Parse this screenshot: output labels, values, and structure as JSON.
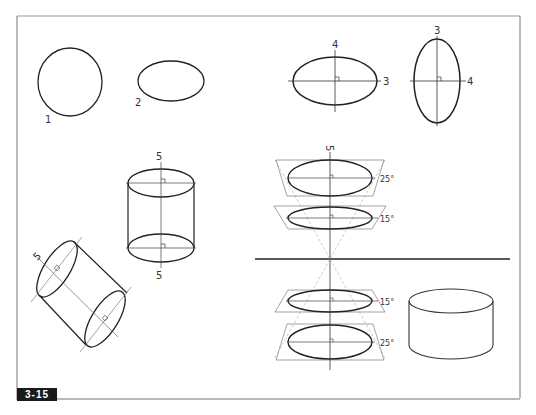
{
  "figure": {
    "label": "3-15",
    "caption_visible": false
  },
  "labels": {
    "circle": "1",
    "ellipse_plain": "2",
    "ellipse_h_minor": "4",
    "ellipse_h_major": "3",
    "ellipse_v_major": "3",
    "ellipse_v_minor": "4",
    "cyl_upright_top": "5",
    "cyl_upright_bottom": "5",
    "cyl_tilted": "5",
    "cone_axis": "5",
    "angle_top_25": "25°",
    "angle_top_15": "15°",
    "angle_bottom_15": "15°",
    "angle_bottom_25": "25°"
  },
  "colors": {
    "ink": "#222222",
    "thin_line": "#555555",
    "guide": "#888888",
    "frame": "#777777",
    "label_bg": "#1a1a1a",
    "label_fg": "#ffffff"
  }
}
